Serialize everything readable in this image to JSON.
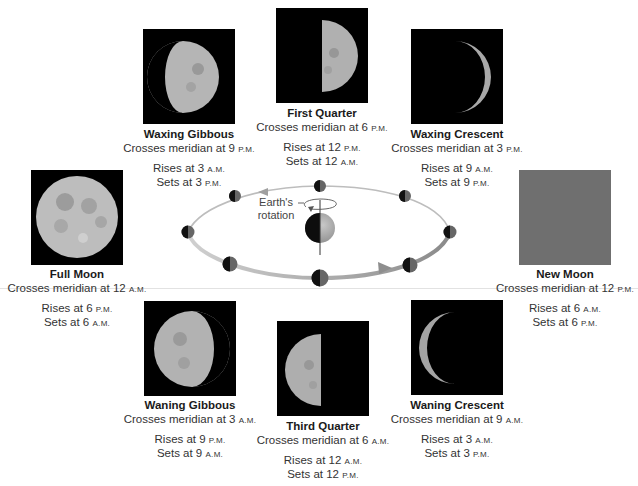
{
  "diagram": {
    "title_hidden": "",
    "earth_label_line1": "Earth's",
    "earth_label_line2": "rotation",
    "colors": {
      "photo_bg": "#000000",
      "new_moon_bg": "#6f6f6f",
      "moon_surface": "#bdbdbd",
      "orbit": "#b8b8b8",
      "text": "#333333"
    }
  },
  "phases": [
    {
      "id": "waxing-gibbous",
      "name": "Waxing Gibbous",
      "meridian_prefix": "Crosses meridian at 9",
      "meridian_suffix": "P.M.",
      "rise_prefix": "Rises at 3",
      "rise_suffix": "A.M.",
      "set_prefix": "Sets at 3",
      "set_suffix": "P.M."
    },
    {
      "id": "first-quarter",
      "name": "First Quarter",
      "meridian_prefix": "Crosses meridian at 6",
      "meridian_suffix": "P.M.",
      "rise_prefix": "Rises at 12",
      "rise_suffix": "P.M.",
      "set_prefix": "Sets at 12",
      "set_suffix": "A.M."
    },
    {
      "id": "waxing-crescent",
      "name": "Waxing Crescent",
      "meridian_prefix": "Crosses meridian at 3",
      "meridian_suffix": "P.M.",
      "rise_prefix": "Rises at 9",
      "rise_suffix": "A.M.",
      "set_prefix": "Sets at 9",
      "set_suffix": "P.M."
    },
    {
      "id": "full-moon",
      "name": "Full Moon",
      "meridian_prefix": "Crosses meridian at 12",
      "meridian_suffix": "A.M.",
      "rise_prefix": "Rises at 6",
      "rise_suffix": "P.M.",
      "set_prefix": "Sets at 6",
      "set_suffix": "A.M."
    },
    {
      "id": "new-moon",
      "name": "New Moon",
      "meridian_prefix": "Crosses meridian at 12",
      "meridian_suffix": "P.M.",
      "rise_prefix": "Rises at 6",
      "rise_suffix": "A.M.",
      "set_prefix": "Sets at 6",
      "set_suffix": "P.M."
    },
    {
      "id": "waning-gibbous",
      "name": "Waning Gibbous",
      "meridian_prefix": "Crosses meridian at 3",
      "meridian_suffix": "A.M.",
      "rise_prefix": "Rises at 9",
      "rise_suffix": "P.M.",
      "set_prefix": "Sets at 9",
      "set_suffix": "A.M."
    },
    {
      "id": "third-quarter",
      "name": "Third Quarter",
      "meridian_prefix": "Crosses meridian at 6",
      "meridian_suffix": "A.M.",
      "rise_prefix": "Rises at 12",
      "rise_suffix": "A.M.",
      "set_prefix": "Sets at 12",
      "set_suffix": "P.M."
    },
    {
      "id": "waning-crescent",
      "name": "Waning Crescent",
      "meridian_prefix": "Crosses meridian at 9",
      "meridian_suffix": "A.M.",
      "rise_prefix": "Rises at 3",
      "rise_suffix": "A.M.",
      "set_prefix": "Sets at 3",
      "set_suffix": "P.M."
    }
  ]
}
